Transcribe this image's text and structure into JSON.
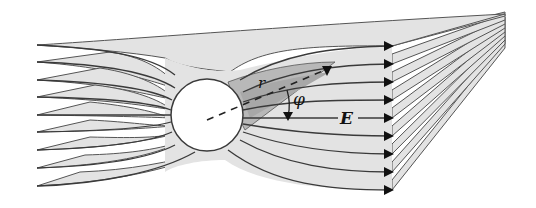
{
  "figure": {
    "type": "field-lines-around-sphere",
    "labels": {
      "radius": "r",
      "angle": "φ",
      "field": "E"
    },
    "colors": {
      "sheet_fill": "#e3e3e3",
      "sheet_shade": "#b8b8b8",
      "line": "#3a3a3a",
      "sphere_fill": "#ffffff",
      "arrow": "#111111"
    },
    "field_line_count": 9,
    "sphere": {
      "cx": 207,
      "cy": 115,
      "r": 36
    }
  }
}
